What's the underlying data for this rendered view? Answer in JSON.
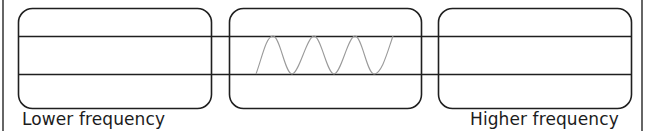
{
  "diagram": {
    "panels": [
      {
        "id": "left",
        "x": 18,
        "y": 8,
        "width": 193,
        "height": 100
      },
      {
        "id": "middle",
        "x": 229,
        "y": 8,
        "width": 192,
        "height": 100
      },
      {
        "id": "right",
        "x": 438,
        "y": 8,
        "width": 193,
        "height": 100
      }
    ],
    "lines": {
      "upper_y": 36,
      "lower_y": 74,
      "x_start": 18,
      "x_end": 631
    },
    "wave": {
      "x_start": 256,
      "x_end": 393,
      "cycles": 3,
      "color": "#9a9a9a"
    },
    "labels": {
      "left": "Lower frequency",
      "right": "Higher frequency"
    },
    "colors": {
      "stroke": "#1f1f1f",
      "wave": "#9a9a9a",
      "text": "#1c1c1c"
    }
  }
}
